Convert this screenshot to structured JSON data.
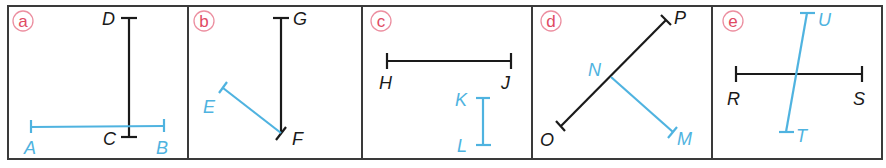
{
  "figure": {
    "panel_count": 5,
    "colors": {
      "frame": "#3a3a3a",
      "black_segment": "#1a1a1a",
      "blue_segment": "#4fb3e0",
      "panel_label": "#e04a63",
      "panel_label_circle": "#ec8fa0"
    },
    "panels": [
      {
        "label": "a",
        "points": {
          "D": "D",
          "C": "C",
          "A": "A",
          "B": "B"
        },
        "segments": [
          {
            "name": "DC",
            "color": "black",
            "from": "D",
            "to": "C"
          },
          {
            "name": "AB",
            "color": "blue",
            "from": "A",
            "to": "B"
          }
        ]
      },
      {
        "label": "b",
        "points": {
          "G": "G",
          "F": "F",
          "E": "E"
        },
        "segments": [
          {
            "name": "GF",
            "color": "black",
            "from": "G",
            "to": "F"
          },
          {
            "name": "EF",
            "color": "blue",
            "from": "E",
            "to": "F"
          }
        ]
      },
      {
        "label": "c",
        "points": {
          "H": "H",
          "J": "J",
          "K": "K",
          "L": "L"
        },
        "segments": [
          {
            "name": "HJ",
            "color": "black",
            "from": "H",
            "to": "J"
          },
          {
            "name": "KL",
            "color": "blue",
            "from": "K",
            "to": "L"
          }
        ]
      },
      {
        "label": "d",
        "points": {
          "P": "P",
          "O": "O",
          "N": "N",
          "M": "M"
        },
        "segments": [
          {
            "name": "OP",
            "color": "black",
            "from": "O",
            "to": "P"
          },
          {
            "name": "NM",
            "color": "blue",
            "from": "N",
            "to": "M"
          }
        ]
      },
      {
        "label": "e",
        "points": {
          "R": "R",
          "S": "S",
          "U": "U",
          "T": "T"
        },
        "segments": [
          {
            "name": "RS",
            "color": "black",
            "from": "R",
            "to": "S"
          },
          {
            "name": "UT",
            "color": "blue",
            "from": "U",
            "to": "T"
          }
        ]
      }
    ]
  }
}
